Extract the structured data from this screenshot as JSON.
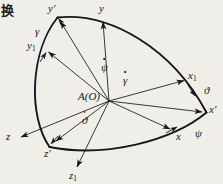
{
  "figure": {
    "page_text": "换",
    "background_color": "#efeee9",
    "ink_color": "#18161a",
    "origin_label": "A(O)"
  },
  "labels": {
    "y_prime": "y′",
    "y": "y",
    "gamma": "γ",
    "y1_base": "y",
    "y1_sub": "1",
    "psi_dot": "ψ",
    "gamma_dot": "γ",
    "x1_base": "x",
    "x1_sub": "1",
    "theta_angle": "ϑ",
    "x_prime": "x′",
    "origin": "A(O)",
    "theta_dot": "ϑ",
    "x": "x",
    "psi_angle": "ψ",
    "z": "z",
    "z_prime": "z′",
    "z1_base": "z",
    "z1_sub": "1"
  },
  "geometry": {
    "origin": {
      "x": 109,
      "y": 101
    },
    "axes": [
      {
        "name": "y-prime-axis",
        "label": "y′",
        "tip": {
          "x": 59,
          "y": 20
        }
      },
      {
        "name": "y-axis",
        "label": "y",
        "tip": {
          "x": 103,
          "y": 19
        }
      },
      {
        "name": "y1-axis",
        "label": "y1",
        "tip": {
          "x": 47,
          "y": 51
        }
      },
      {
        "name": "x1-axis",
        "label": "x1",
        "tip": {
          "x": 186,
          "y": 81
        }
      },
      {
        "name": "x-prime-axis",
        "label": "x′",
        "tip": {
          "x": 203,
          "y": 112
        }
      },
      {
        "name": "x-axis",
        "label": "x",
        "tip": {
          "x": 172,
          "y": 130
        }
      },
      {
        "name": "z-axis",
        "label": "z",
        "tip": {
          "x": 19,
          "y": 138
        }
      },
      {
        "name": "z-prime-axis",
        "label": "z′",
        "tip": {
          "x": 54,
          "y": 143
        }
      },
      {
        "name": "z1-axis",
        "label": "z1",
        "tip": {
          "x": 76,
          "y": 169
        }
      }
    ],
    "arcs": [
      {
        "name": "arc-yprime-to-xprime",
        "from": {
          "x": 57,
          "y": 17
        },
        "to": {
          "x": 206,
          "y": 113
        }
      },
      {
        "name": "arc-yprime-to-zprime",
        "from": {
          "x": 57,
          "y": 17
        },
        "to": {
          "x": 49,
          "y": 147
        }
      },
      {
        "name": "arc-zprime-to-xprime",
        "from": {
          "x": 49,
          "y": 147
        },
        "to": {
          "x": 206,
          "y": 113
        }
      }
    ]
  }
}
